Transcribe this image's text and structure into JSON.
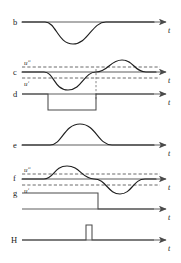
{
  "figure": {
    "axis_label": "t",
    "threshold_upper_label": "uʺ",
    "threshold_lower_label": "uʹ",
    "line_color": "#1f1f1f",
    "axis_color": "#5f5f5f",
    "dash_color": "#5a5a5a",
    "background": "#ffffff"
  },
  "rows": [
    {
      "id": "b",
      "label": "b",
      "axis_label": "t",
      "signal_type": "negative-bump",
      "thresholds": [],
      "description": "Smooth single negative excursion below the time axis"
    },
    {
      "id": "c",
      "label": "c",
      "axis_label": "t",
      "signal_type": "sine-negative-then-positive",
      "thresholds": [
        "uʺ",
        "uʹ"
      ],
      "description": "Sinusoid dipping below lower threshold then rising above upper threshold"
    },
    {
      "id": "d",
      "label": "d",
      "axis_label": "t",
      "signal_type": "negative-pulse",
      "thresholds": [],
      "description": "Rectangular pulse stepping down then back up"
    },
    {
      "id": "e",
      "label": "e",
      "axis_label": "t",
      "signal_type": "positive-bump",
      "thresholds": [],
      "description": "Smooth single positive excursion above the time axis"
    },
    {
      "id": "f",
      "label": "f",
      "axis_label": "t",
      "signal_type": "sine-positive-then-negative",
      "thresholds": [
        "uʺ",
        "uʹ"
      ],
      "description": "Sinusoid rising above upper threshold then dipping below lower threshold"
    },
    {
      "id": "g",
      "label": "g",
      "axis_label": "t",
      "signal_type": "falling-step",
      "thresholds": [],
      "description": "Level high then stepping down and remaining low"
    },
    {
      "id": "H",
      "label": "H",
      "axis_label": "t",
      "signal_type": "narrow-positive-pulse",
      "thresholds": [],
      "description": "Single narrow upward spike on the baseline"
    }
  ]
}
